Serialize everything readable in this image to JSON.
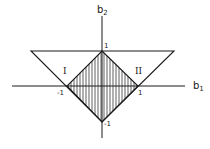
{
  "axes": {
    "x_label_main": "b",
    "x_label_sub": "1",
    "y_label_main": "b",
    "y_label_sub": "2"
  },
  "ticks": {
    "x_neg": "-1",
    "x_pos": "1",
    "y_pos": "1",
    "y_neg": "-1"
  },
  "regions": {
    "left": "I",
    "right": "II"
  },
  "colors": {
    "line": "#1a1a1a",
    "background": "#ffffff"
  }
}
